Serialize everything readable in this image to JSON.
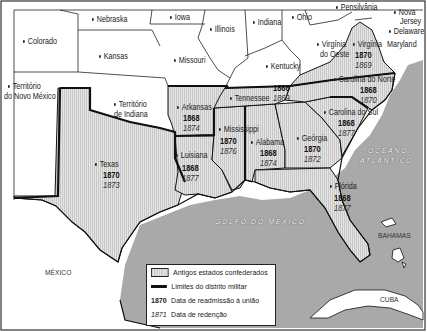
{
  "colors": {
    "sea": "#a9a9a9",
    "confederate_fill": "#d9d9d9",
    "union_fill": "#ffffff",
    "border": "#111111"
  },
  "states": {
    "nebraska": {
      "name": "Nebraska"
    },
    "iowa": {
      "name": "Iowa"
    },
    "illinois": {
      "name": "Illinois"
    },
    "indiana": {
      "name": "Indiana"
    },
    "ohio": {
      "name": "Ohio"
    },
    "pensilvania": {
      "name": "Pensilvânia"
    },
    "nova_jersey": {
      "name": "Nova Jersey"
    },
    "nova_jersey_l1": {
      "name": "Nova"
    },
    "nova_jersey_l2": {
      "name": "Jersey"
    },
    "delaware": {
      "name": "Delaware"
    },
    "maryland": {
      "name": "Maryland"
    },
    "colorado": {
      "name": "Colorado"
    },
    "kansas": {
      "name": "Kansas"
    },
    "missouri": {
      "name": "Missouri"
    },
    "kentucky": {
      "name": "Kentucky"
    },
    "virginia_oeste_l1": {
      "name": "Virgínia"
    },
    "virginia_oeste_l2": {
      "name": "do Oeste"
    },
    "territorio_nm_l1": {
      "name": "Território"
    },
    "territorio_nm_l2": {
      "name": "do Novo México"
    },
    "territorio_in_l1": {
      "name": "Território"
    },
    "territorio_in_l2": {
      "name": "de Indiana"
    }
  },
  "confederate": {
    "virginia": {
      "name": "Virgínia",
      "readmission": "1870",
      "redemption": "1869"
    },
    "carolina_norte": {
      "name": "Carolina do Norte",
      "readmission": "1868",
      "redemption": "1870"
    },
    "tennessee": {
      "name": "Tennessee",
      "readmission": "1866",
      "redemption": "1869"
    },
    "carolina_sul": {
      "name": "Carolina do Sul",
      "readmission": "1868",
      "redemption": "1877"
    },
    "arkansas": {
      "name": "Arkansas",
      "readmission": "1868",
      "redemption": "1874"
    },
    "mississippi": {
      "name": "Mississippi",
      "readmission": "1870",
      "redemption": "1876"
    },
    "alabama": {
      "name": "Alabama",
      "readmission": "1868",
      "redemption": "1874"
    },
    "georgia": {
      "name": "Geórgia",
      "readmission": "1870",
      "redemption": "1872"
    },
    "texas": {
      "name": "Texas",
      "readmission": "1870",
      "redemption": "1873"
    },
    "luisiana": {
      "name": "Luisiana",
      "readmission": "1868",
      "redemption": "1877"
    },
    "florida": {
      "name": "Flórida",
      "readmission": "1868",
      "redemption": "1877"
    }
  },
  "water": {
    "atlantic_l1": "OCEANO",
    "atlantic_l2": "ATLÂNTICO",
    "gulf": "GOLFO DO MÉXICO"
  },
  "countries": {
    "mexico": "MÉXICO",
    "bahamas": "BAHAMAS",
    "cuba": "CUBA"
  },
  "legend": {
    "confederate_label": "Antigos estados confederados",
    "district_label": "Limites do distrito militar",
    "readmission_sample": "1870",
    "readmission_label": "Data de readmissão à união",
    "redemption_sample": "1871",
    "redemption_label": "Data de redenção"
  }
}
